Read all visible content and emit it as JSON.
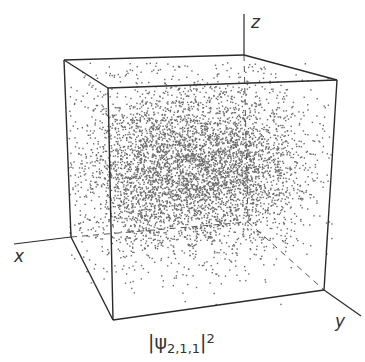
{
  "figure": {
    "axes": {
      "x_label": "x",
      "y_label": "y",
      "z_label": "z"
    },
    "caption": {
      "bar_left": "|",
      "symbol": "ψ",
      "subscript": "2,1,1",
      "bar_right": "|",
      "superscript": "2"
    },
    "colors": {
      "edge": "#2b2b2b",
      "dot": "#6b6b6b",
      "background": "#ffffff"
    }
  },
  "chart_data": {
    "type": "scatter",
    "xlabel": "x",
    "ylabel": "y",
    "zlabel": "z",
    "grid": false,
    "legend": null,
    "cube_vertices_px": {
      "back_top_left": [
        64,
        60
      ],
      "back_top_right": [
        244,
        55
      ],
      "front_top_left": [
        108,
        88
      ],
      "front_top_right": [
        337,
        80
      ],
      "back_bottom_left": [
        71,
        237
      ],
      "back_bottom_right_hidden": [
        248,
        222
      ],
      "front_bottom_left": [
        113,
        320
      ],
      "front_bottom_right": [
        324,
        290
      ]
    },
    "lobes_px": [
      {
        "center": [
          150,
          170
        ],
        "spread": [
          40,
          45
        ],
        "points": 2600
      },
      {
        "center": [
          232,
          165
        ],
        "spread": [
          40,
          42
        ],
        "points": 2600
      }
    ]
  }
}
